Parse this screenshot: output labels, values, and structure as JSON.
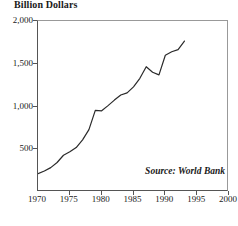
{
  "chart_data": {
    "type": "line",
    "title": "Billion Dollars",
    "xlabel": "",
    "ylabel": "Billion Dollars",
    "xlim": [
      1970,
      2000
    ],
    "ylim": [
      0,
      2000
    ],
    "grid": false,
    "legend": null,
    "annotations": [
      {
        "name": "source",
        "text": "Source: World Bank",
        "position": "bottom-right-inside"
      }
    ],
    "xticks": [
      1970,
      1975,
      1980,
      1985,
      1990,
      1995,
      2000
    ],
    "xtick_labels": [
      "1970",
      "1975",
      "1980",
      "1985",
      "1990",
      "1995",
      "2000"
    ],
    "yticks": [
      500,
      1000,
      1500,
      2000
    ],
    "ytick_labels": [
      "500",
      "1,000",
      "1,500",
      "2,000"
    ],
    "x": [
      1970,
      1971,
      1972,
      1973,
      1974,
      1975,
      1976,
      1977,
      1978,
      1979,
      1980,
      1981,
      1982,
      1983,
      1984,
      1985,
      1986,
      1987,
      1988,
      1989,
      1990,
      1991,
      1992,
      1993
    ],
    "values": [
      215,
      245,
      285,
      345,
      430,
      470,
      520,
      610,
      730,
      955,
      950,
      1010,
      1075,
      1135,
      1160,
      1230,
      1330,
      1465,
      1400,
      1370,
      1600,
      1640,
      1665,
      1765
    ],
    "series": [
      {
        "name": "Total external debt",
        "units": "Billion Dollars",
        "values": [
          215,
          245,
          285,
          345,
          430,
          470,
          520,
          610,
          730,
          955,
          950,
          1010,
          1075,
          1135,
          1160,
          1230,
          1330,
          1465,
          1400,
          1370,
          1600,
          1640,
          1665,
          1765
        ]
      }
    ],
    "line_color": "#2a2a2a",
    "line_width": 1.2
  },
  "figure": {
    "title": "Billion Dollars",
    "source": "Source: World Bank",
    "background": "#ffffff",
    "axis_color": "#555555"
  }
}
